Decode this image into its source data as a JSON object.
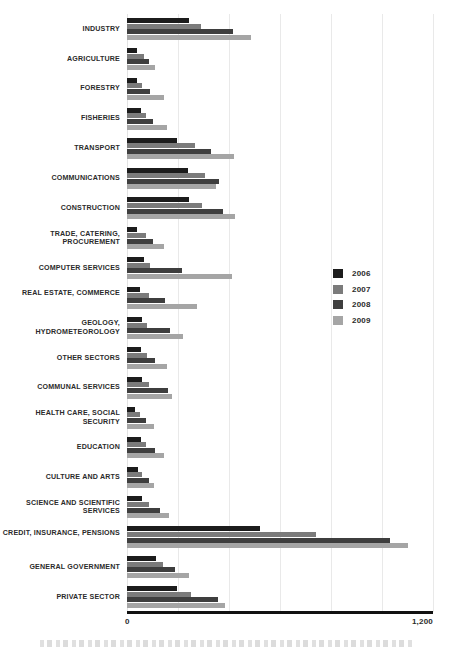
{
  "chart_data": {
    "type": "bar",
    "orientation": "horizontal",
    "title": "",
    "xlabel": "",
    "ylabel": "",
    "xlim": [
      0,
      1200
    ],
    "xticks": [
      0,
      1200
    ],
    "xtick_labels": [
      "0",
      "1,200"
    ],
    "grid": true,
    "gridline_values": [
      0,
      200,
      400,
      600,
      800,
      1000,
      1200
    ],
    "legend_position": "middle-right",
    "categories": [
      "INDUSTRY",
      "AGRICULTURE",
      "FORESTRY",
      "FISHERIES",
      "TRANSPORT",
      "COMMUNICATIONS",
      "CONSTRUCTION",
      "TRADE, CATERING, PROCUREMENT",
      "COMPUTER SERVICES",
      "REAL ESTATE, COMMERCE",
      "GEOLOGY, HYDROMETEOROLOGY",
      "OTHER SECTORS",
      "COMMUNAL SERVICES",
      "HEALTH CARE, SOCIAL SECURITY",
      "EDUCATION",
      "CULTURE AND ARTS",
      "SCIENCE AND SCIENTIFIC SERVICES",
      "CREDIT, INSURANCE, PENSIONS",
      "GENERAL GOVERNMENT",
      "PRIVATE SECTOR"
    ],
    "series": [
      {
        "name": "2006",
        "color": "#1c1c1c",
        "values": [
          245,
          40,
          40,
          55,
          195,
          240,
          245,
          40,
          65,
          50,
          60,
          55,
          60,
          30,
          55,
          45,
          60,
          520,
          115,
          195
        ]
      },
      {
        "name": "2007",
        "color": "#7b7b7b",
        "values": [
          290,
          65,
          60,
          75,
          265,
          305,
          295,
          75,
          90,
          85,
          80,
          80,
          85,
          50,
          75,
          60,
          85,
          740,
          140,
          250
        ]
      },
      {
        "name": "2008",
        "color": "#3e3e3e",
        "values": [
          415,
          85,
          90,
          100,
          330,
          360,
          375,
          100,
          215,
          150,
          170,
          110,
          160,
          75,
          110,
          85,
          130,
          1030,
          190,
          355
        ]
      },
      {
        "name": "2009",
        "color": "#a5a5a5",
        "values": [
          485,
          110,
          145,
          155,
          420,
          350,
          425,
          145,
          410,
          275,
          220,
          155,
          175,
          105,
          145,
          105,
          165,
          1100,
          245,
          385
        ]
      }
    ]
  },
  "axis": {
    "min_label": "0",
    "max_label": "1,200"
  },
  "legend": {
    "items": [
      {
        "label": "2006",
        "color": "#1c1c1c",
        "swatch_name": "legend-swatch-2006"
      },
      {
        "label": "2007",
        "color": "#7b7b7b",
        "swatch_name": "legend-swatch-2007"
      },
      {
        "label": "2008",
        "color": "#3e3e3e",
        "swatch_name": "legend-swatch-2008"
      },
      {
        "label": "2009",
        "color": "#a5a5a5",
        "swatch_name": "legend-swatch-2009"
      }
    ]
  }
}
